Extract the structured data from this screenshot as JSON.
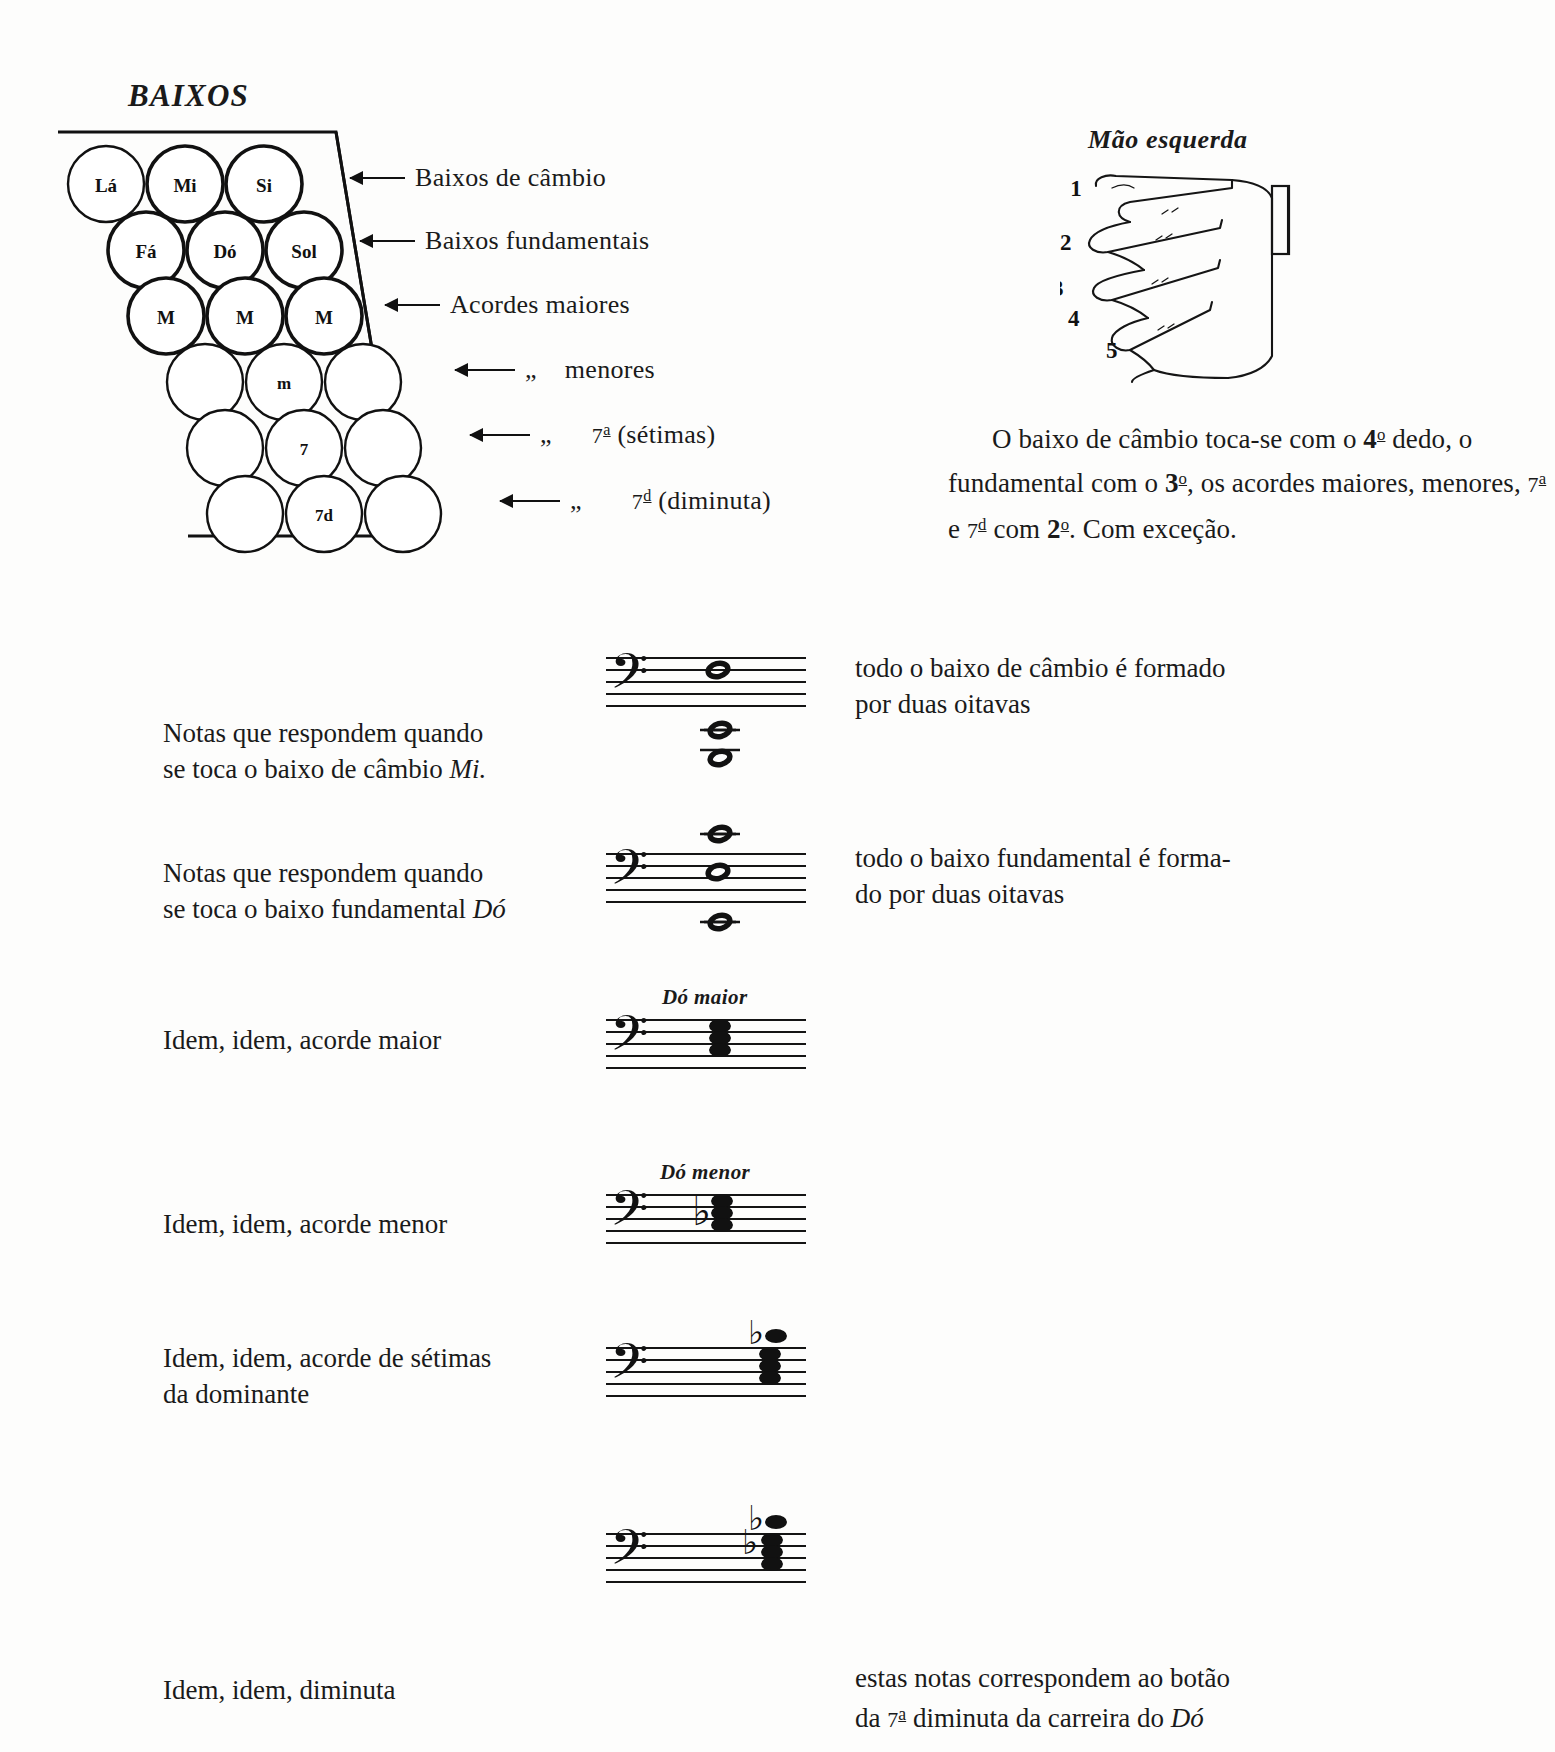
{
  "page": {
    "language": "pt",
    "title_baixos": "BAIXOS",
    "title_mao": "Mão esquerda",
    "ink_color": "#111111",
    "paper_color": "#fdfdfc"
  },
  "bass_board": {
    "rows": [
      {
        "id": "row-cambio",
        "labels": [
          "Lá",
          "Mi",
          "Si"
        ],
        "arrow_label_prefix": "",
        "arrow_label": "Baixos de câmbio"
      },
      {
        "id": "row-fundamentais",
        "labels": [
          "Fá",
          "Dó",
          "Sol"
        ],
        "arrow_label_prefix": "",
        "arrow_label": "Baixos fundamentais"
      },
      {
        "id": "row-maiores",
        "labels": [
          "M",
          "M",
          "M"
        ],
        "arrow_label_prefix": "",
        "arrow_label": "Acordes maiores"
      },
      {
        "id": "row-menores",
        "labels": [
          "",
          "m",
          ""
        ],
        "arrow_label_prefix": "„",
        "arrow_label": "menores"
      },
      {
        "id": "row-setimas",
        "labels": [
          "",
          "7",
          ""
        ],
        "arrow_label_prefix": "„",
        "arrow_label_pre": "7",
        "arrow_label_sup": "a",
        "arrow_label_post": " (sétimas)"
      },
      {
        "id": "row-diminuta",
        "labels": [
          "",
          "7d",
          ""
        ],
        "arrow_label_prefix": "„",
        "arrow_label_pre": "7",
        "arrow_label_sup": "d",
        "arrow_label_post": " (diminuta)"
      }
    ]
  },
  "hand": {
    "finger_numbers": [
      "1",
      "2",
      "3",
      "4",
      "5"
    ]
  },
  "right_paragraph": {
    "line1_a": "O baixo de câmbio toca-se com",
    "line2_a": "o ",
    "line2_b": "4",
    "line2_sup": "o",
    "line2_c": " dedo, o fundamental com o ",
    "line2_d": "3",
    "line2_sup2": "o",
    "line2_e": ",",
    "line3_a": "os acordes maiores, menores, ",
    "line3_b": "7",
    "line3_sup": "a",
    "line3_c": " e ",
    "line3_d": "7",
    "line3_sup2": "d",
    "line4_a": "com ",
    "line4_b": "2",
    "line4_sup": "o",
    "line4_c": ". Com exceção."
  },
  "examples": [
    {
      "id": "ex-cambio-mi",
      "left_line1": "Notas que respondem quando",
      "left_line2_a": "se toca o baixo de câmbio ",
      "left_line2_i": "Mi.",
      "chord_title": "",
      "right_line1": "todo o baixo de câmbio é formado",
      "right_line2": "por duas oitavas"
    },
    {
      "id": "ex-fundamental-do",
      "left_line1": "Notas que respondem quando",
      "left_line2_a": "se toca o baixo fundamental ",
      "left_line2_i": "Dó",
      "chord_title": "",
      "right_line1": "todo o baixo fundamental é forma-",
      "right_line2": "do por duas oitavas"
    },
    {
      "id": "ex-acorde-maior",
      "left_line1": "Idem, idem, acorde maior",
      "left_line2_a": "",
      "left_line2_i": "",
      "chord_title": "Dó maior",
      "right_line1": "",
      "right_line2": ""
    },
    {
      "id": "ex-acorde-menor",
      "left_line1": "Idem, idem, acorde menor",
      "left_line2_a": "",
      "left_line2_i": "",
      "chord_title": "Dó menor",
      "right_line1": "",
      "right_line2": ""
    },
    {
      "id": "ex-setima-dominante",
      "left_line1": "Idem, idem, acorde de sétimas",
      "left_line2_a": "da dominante",
      "left_line2_i": "",
      "chord_title": "",
      "right_line1": "",
      "right_line2": ""
    },
    {
      "id": "ex-diminuta",
      "left_line1": "Idem, idem, diminuta",
      "left_line2_a": "",
      "left_line2_i": "",
      "chord_title": "",
      "right_line1": "estas notas correspondem ao botão",
      "right_line2_a": "da ",
      "right_line2_b": "7",
      "right_line2_sup": "a",
      "right_line2_c": " diminuta da carreira do ",
      "right_line2_i": "Dó"
    }
  ],
  "icons": {
    "bass_clef": "𝄢",
    "flat": "♭",
    "arrow_left": "arrow-left-icon"
  }
}
